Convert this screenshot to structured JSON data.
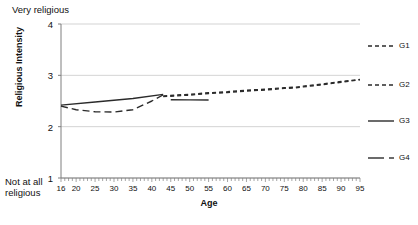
{
  "chart_data": {
    "type": "line",
    "title": "",
    "xlabel": "Age",
    "ylabel": "Religious Intensity",
    "xlim": [
      16,
      95
    ],
    "ylim": [
      1,
      4
    ],
    "grid": "horizontal",
    "y_anchor_high": "Very religious",
    "y_anchor_low_line1": "Not at all",
    "y_anchor_low_line2": "religious",
    "yticks": [
      4,
      3,
      2,
      1
    ],
    "xticks": [
      16,
      20,
      25,
      30,
      35,
      40,
      45,
      50,
      55,
      60,
      65,
      70,
      75,
      80,
      85,
      90,
      95
    ],
    "minor_tick_step": 1,
    "legend_position": "right",
    "line_color": "#2b2b2b",
    "grid_color": "#c8c8c8",
    "axis_color": "#7f7f7f",
    "series": [
      {
        "name": "G1",
        "style": "dashed",
        "dash": "4,3",
        "points": [
          [
            43,
            2.6
          ],
          [
            50,
            2.63
          ],
          [
            55,
            2.66
          ],
          [
            60,
            2.68
          ],
          [
            65,
            2.71
          ],
          [
            70,
            2.73
          ],
          [
            75,
            2.76
          ],
          [
            78,
            2.77
          ],
          [
            80,
            2.79
          ],
          [
            85,
            2.83
          ],
          [
            90,
            2.88
          ],
          [
            95,
            2.92
          ]
        ]
      },
      {
        "name": "G2",
        "style": "dashed",
        "dash": "4,3",
        "points": [
          [
            43,
            2.585
          ],
          [
            50,
            2.615
          ],
          [
            55,
            2.645
          ],
          [
            60,
            2.665
          ],
          [
            65,
            2.695
          ],
          [
            70,
            2.715
          ],
          [
            75,
            2.745
          ],
          [
            78,
            2.755
          ],
          [
            80,
            2.775
          ],
          [
            85,
            2.815
          ],
          [
            90,
            2.865
          ],
          [
            95,
            2.915
          ]
        ]
      },
      {
        "name": "G3",
        "style": "solid",
        "dash": "",
        "points": [
          [
            16,
            2.42
          ],
          [
            25,
            2.48
          ],
          [
            35,
            2.55
          ],
          [
            43,
            2.63
          ]
        ]
      },
      {
        "name": "G3b",
        "style": "solid",
        "dash": "",
        "points": [
          [
            45,
            2.525
          ],
          [
            50,
            2.522
          ],
          [
            55,
            2.52
          ]
        ]
      },
      {
        "name": "G4",
        "style": "dashed",
        "dash": "7,4",
        "points": [
          [
            16,
            2.4
          ],
          [
            20,
            2.33
          ],
          [
            25,
            2.29
          ],
          [
            30,
            2.285
          ],
          [
            35,
            2.33
          ],
          [
            40,
            2.5
          ],
          [
            43,
            2.62
          ]
        ]
      }
    ],
    "legend": [
      {
        "label": "G1",
        "style": "dashed",
        "dash": "4,3"
      },
      {
        "label": "G2",
        "style": "dashed",
        "dash": "4,3"
      },
      {
        "label": "G3",
        "style": "solid",
        "dash": ""
      },
      {
        "label": "G4",
        "style": "solid-dash",
        "dash": ""
      }
    ]
  }
}
